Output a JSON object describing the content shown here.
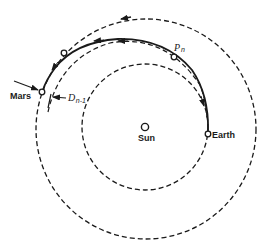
{
  "figure": {
    "type": "orbital-transfer-diagram",
    "colors": {
      "ink": "#1a1a1a",
      "background": "#ffffff"
    },
    "labels": {
      "sun": "Sun",
      "earth": "Earth",
      "mars": "Mars",
      "pn_main": "P",
      "pn_sub": "n",
      "dn_main": "D",
      "dn_sub": "n-1"
    },
    "bodies": [
      {
        "name": "Sun",
        "x": 145,
        "y": 127
      },
      {
        "name": "Earth",
        "x": 208,
        "y": 133
      },
      {
        "name": "Mars",
        "x": 42,
        "y": 91
      },
      {
        "name": "Pn",
        "x": 174,
        "y": 57
      },
      {
        "name": "intermediate-point",
        "x": 64,
        "y": 53
      }
    ],
    "orbits": [
      {
        "name": "Earth orbit",
        "style": "dashed",
        "cx": 145,
        "cy": 127,
        "r": 63
      },
      {
        "name": "Mars orbit",
        "style": "dashed",
        "cx": 146,
        "cy": 129,
        "r": 110
      }
    ],
    "trajectory": {
      "from": "Earth",
      "to": "Mars",
      "style": "solid"
    }
  }
}
